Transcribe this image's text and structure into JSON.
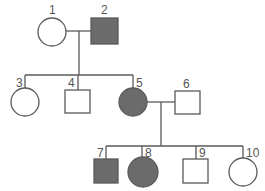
{
  "diagram": {
    "type": "pedigree",
    "colors": {
      "line": "#5a5a5a",
      "affected_fill": "#6b6b6b",
      "unaffected_fill": "#ffffff"
    },
    "individuals": [
      {
        "id": "1",
        "label": "1",
        "sex": "female",
        "affected": false,
        "generation": 1
      },
      {
        "id": "2",
        "label": "2",
        "sex": "male",
        "affected": true,
        "generation": 1
      },
      {
        "id": "3",
        "label": "3",
        "sex": "female",
        "affected": false,
        "generation": 2
      },
      {
        "id": "4",
        "label": "4",
        "sex": "male",
        "affected": false,
        "generation": 2
      },
      {
        "id": "5",
        "label": "5",
        "sex": "female",
        "affected": true,
        "generation": 2
      },
      {
        "id": "6",
        "label": "6",
        "sex": "male",
        "affected": false,
        "generation": 2
      },
      {
        "id": "7",
        "label": "7",
        "sex": "male",
        "affected": true,
        "generation": 3
      },
      {
        "id": "8",
        "label": "8",
        "sex": "female",
        "affected": true,
        "generation": 3
      },
      {
        "id": "9",
        "label": "9",
        "sex": "male",
        "affected": false,
        "generation": 3
      },
      {
        "id": "10",
        "label": "10",
        "sex": "female",
        "affected": false,
        "generation": 3
      }
    ],
    "matings": [
      {
        "parents": [
          "1",
          "2"
        ],
        "children": [
          "3",
          "4",
          "5"
        ]
      },
      {
        "parents": [
          "5",
          "6"
        ],
        "children": [
          "7",
          "8",
          "9",
          "10"
        ]
      }
    ]
  }
}
